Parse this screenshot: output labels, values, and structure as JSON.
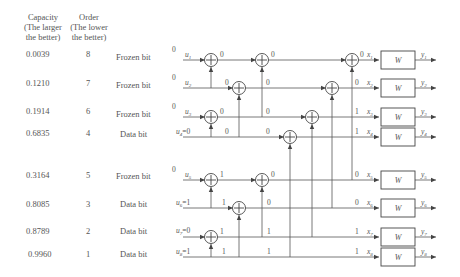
{
  "headers": {
    "capacity": [
      "Capacity",
      "(The larger",
      "the better)"
    ],
    "order": [
      "Order",
      "(The lower",
      "the better)"
    ]
  },
  "rows": [
    {
      "capacity": "0.0039",
      "order": "8",
      "type": "Frozen bit",
      "input_value": "0",
      "input_label": "u",
      "input_sub": "1",
      "x_sub": "1",
      "y_sub": "1",
      "out_bit": "0"
    },
    {
      "capacity": "0.1210",
      "order": "7",
      "type": "Frozen bit",
      "input_value": "0",
      "input_label": "u",
      "input_sub": "2",
      "x_sub": "2",
      "y_sub": "2",
      "out_bit": "0"
    },
    {
      "capacity": "0.1914",
      "order": "6",
      "type": "Frozen bit",
      "input_value": "0",
      "input_label": "u",
      "input_sub": "3",
      "x_sub": "3",
      "y_sub": "3",
      "out_bit": "1"
    },
    {
      "capacity": "0.6835",
      "order": "4",
      "type": "Data bit",
      "input_value": "",
      "input_label": "u",
      "input_sub": "4",
      "input_assign": "=0",
      "x_sub": "4",
      "y_sub": "4",
      "out_bit": "1"
    },
    {
      "capacity": "0.3164",
      "order": "5",
      "type": "Frozen bit",
      "input_value": "0",
      "input_label": "u",
      "input_sub": "5",
      "x_sub": "5",
      "y_sub": "5",
      "out_bit": "0"
    },
    {
      "capacity": "0.8085",
      "order": "3",
      "type": "Data bit",
      "input_value": "",
      "input_label": "u",
      "input_sub": "6",
      "input_assign": "=1",
      "x_sub": "6",
      "y_sub": "6",
      "out_bit": "0"
    },
    {
      "capacity": "0.8789",
      "order": "2",
      "type": "Data bit",
      "input_value": "",
      "input_label": "u",
      "input_sub": "7",
      "input_assign": "=0",
      "x_sub": "7",
      "y_sub": "7",
      "out_bit": "1"
    },
    {
      "capacity": "0.9960",
      "order": "1",
      "type": "Data bit",
      "input_value": "",
      "input_label": "u",
      "input_sub": "8",
      "input_assign": "=1",
      "x_sub": "8",
      "y_sub": "8",
      "out_bit": "1"
    }
  ],
  "channel_label": "W",
  "stage1_bits": [
    "0",
    "0",
    "0",
    "0",
    "1",
    "1",
    "1",
    "1"
  ],
  "stage2_bits": [
    "0",
    "0",
    "0",
    "0",
    "0",
    "0",
    "1",
    "1"
  ],
  "colors": {
    "line": "#555555",
    "text": "#555555",
    "background": "#ffffff"
  }
}
